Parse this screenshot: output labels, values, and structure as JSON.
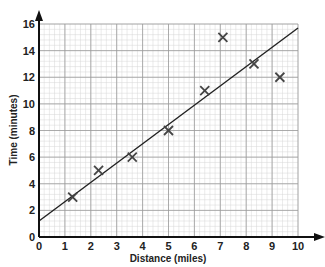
{
  "chart_data": {
    "type": "scatter",
    "title": "",
    "xlabel": "Distance (miles)",
    "ylabel": "Time (minutes)",
    "xlim": [
      0,
      10
    ],
    "ylim": [
      0,
      16
    ],
    "x_ticks": [
      0,
      1,
      2,
      3,
      4,
      5,
      6,
      7,
      8,
      9,
      10
    ],
    "y_ticks": [
      0,
      2,
      4,
      6,
      8,
      10,
      12,
      14,
      16
    ],
    "grid": true,
    "grid_minor_step_x": 0.2,
    "grid_minor_step_y": 0.4,
    "marker": "x",
    "series": [
      {
        "name": "observations",
        "points": [
          {
            "x": 1.3,
            "y": 3
          },
          {
            "x": 2.3,
            "y": 5
          },
          {
            "x": 3.6,
            "y": 6
          },
          {
            "x": 5.0,
            "y": 8
          },
          {
            "x": 6.4,
            "y": 11
          },
          {
            "x": 7.1,
            "y": 15
          },
          {
            "x": 8.3,
            "y": 13
          },
          {
            "x": 9.3,
            "y": 12
          }
        ]
      }
    ],
    "trend_line": {
      "x0": 0,
      "y0": 1.2,
      "x1": 10,
      "y1": 15.7
    },
    "legend": null
  },
  "colors": {
    "axis": "#111111",
    "grid_major": "#9a9a9a",
    "grid_minor": "#d6d6d6",
    "marker": "#444444",
    "line": "#222222"
  }
}
